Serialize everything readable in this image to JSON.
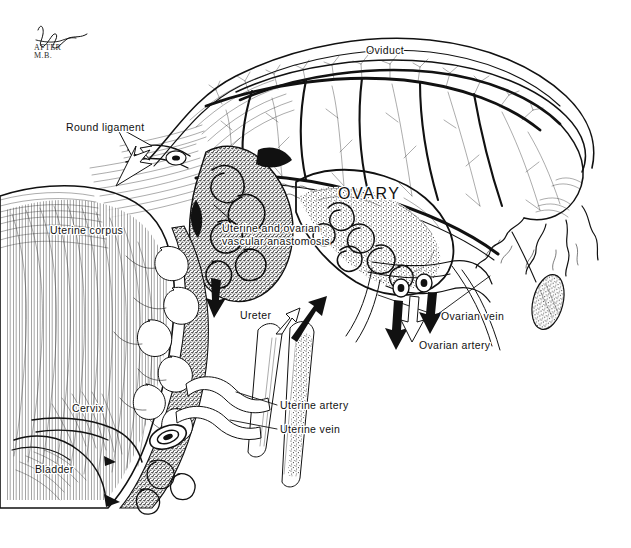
{
  "figure": {
    "kind": "anatomical-line-illustration",
    "background_color": "#ffffff",
    "ink_color": "#111111",
    "width": 631,
    "height": 548
  },
  "signature": {
    "name_mark": "artist-signature-scrawl",
    "line1": "AFTER",
    "line2": "M.B."
  },
  "labels": [
    {
      "id": "oviduct",
      "text": "Oviduct",
      "x": 366,
      "y": 54,
      "size": "normal",
      "anchor": "start"
    },
    {
      "id": "ovary",
      "text": "OVARY",
      "x": 338,
      "y": 199,
      "size": "big",
      "anchor": "start"
    },
    {
      "id": "round-ligament",
      "text": "Round ligament",
      "x": 66,
      "y": 131,
      "size": "normal",
      "anchor": "start"
    },
    {
      "id": "uterine-corpus",
      "text": "Uterine corpus",
      "x": 50,
      "y": 234,
      "size": "normal",
      "anchor": "start"
    },
    {
      "id": "anastomosis-line1",
      "text": "Uterine and ovarian",
      "x": 222,
      "y": 232,
      "size": "normal",
      "anchor": "start"
    },
    {
      "id": "anastomosis-line2",
      "text": "vascular anastomosis",
      "x": 222,
      "y": 245,
      "size": "normal",
      "anchor": "start"
    },
    {
      "id": "ureter",
      "text": "Ureter",
      "x": 240,
      "y": 319,
      "size": "normal",
      "anchor": "start"
    },
    {
      "id": "ovarian-vein",
      "text": "Ovarian vein",
      "x": 441,
      "y": 320,
      "size": "normal",
      "anchor": "start"
    },
    {
      "id": "ovarian-artery",
      "text": "Ovarian artery",
      "x": 419,
      "y": 349,
      "size": "normal",
      "anchor": "start"
    },
    {
      "id": "uterine-artery",
      "text": "Uterine artery",
      "x": 280,
      "y": 409,
      "size": "normal",
      "anchor": "start"
    },
    {
      "id": "uterine-vein",
      "text": "Uterine vein",
      "x": 280,
      "y": 433,
      "size": "normal",
      "anchor": "start"
    },
    {
      "id": "cervix",
      "text": "Cervix",
      "x": 72,
      "y": 412,
      "size": "normal",
      "anchor": "start"
    },
    {
      "id": "bladder",
      "text": "Bladder",
      "x": 35,
      "y": 473,
      "size": "normal",
      "anchor": "start"
    }
  ],
  "arrows": [
    {
      "id": "round-ligament-arrow-upper",
      "style": "outline",
      "direction": "right",
      "x": 150,
      "y": 142
    },
    {
      "id": "round-ligament-arrow-lower",
      "style": "outline",
      "direction": "right",
      "x": 150,
      "y": 163
    },
    {
      "id": "uterine-descending-arrow",
      "style": "solid",
      "direction": "down",
      "x": 215,
      "y": 290
    },
    {
      "id": "ureter-arrow-outline",
      "style": "outline",
      "direction": "up-right",
      "x": 288,
      "y": 320
    },
    {
      "id": "ureter-arrow-solid",
      "style": "solid",
      "direction": "up-right",
      "x": 305,
      "y": 318
    },
    {
      "id": "ovarian-arrow-left",
      "style": "solid",
      "direction": "down",
      "x": 398,
      "y": 305
    },
    {
      "id": "ovarian-arrow-middle",
      "style": "outline",
      "direction": "down",
      "x": 414,
      "y": 300
    },
    {
      "id": "ovarian-arrow-right",
      "style": "solid",
      "direction": "down",
      "x": 432,
      "y": 298
    }
  ],
  "structures": [
    {
      "id": "uterine-corpus-body",
      "name": "uterine corpus wall with hatched myometrium"
    },
    {
      "id": "cervix-body",
      "name": "cervix"
    },
    {
      "id": "bladder-body",
      "name": "bladder"
    },
    {
      "id": "broad-ligament",
      "name": "broad ligament / mesosalpinx sheet"
    },
    {
      "id": "oviduct-tube",
      "name": "oviduct (fallopian tube)"
    },
    {
      "id": "ovary-body",
      "name": "ovary"
    },
    {
      "id": "fimbriae",
      "name": "fimbriae of the infundibulum"
    },
    {
      "id": "hydatid-cyst",
      "name": "pedunculated hydatid cyst"
    },
    {
      "id": "vascular-arcade",
      "name": "tubo-ovarian vascular arcade"
    },
    {
      "id": "uterine-vessels",
      "name": "coiled uterine vessels along the uterine margin"
    },
    {
      "id": "ureter-tube",
      "name": "ureter"
    },
    {
      "id": "ovarian-vessel-stumps",
      "name": "cut ovarian vessel stumps"
    }
  ]
}
